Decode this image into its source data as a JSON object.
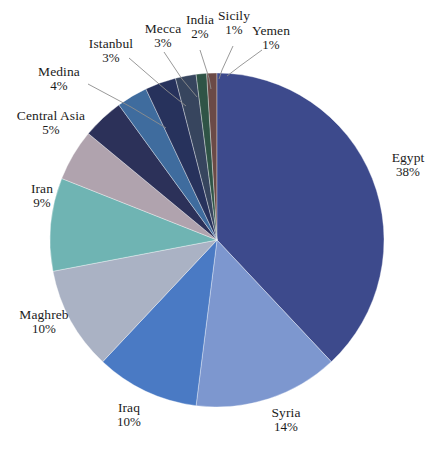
{
  "chart_data": {
    "type": "pie",
    "title": "",
    "subtitle": "",
    "xlabel": "",
    "ylabel": "",
    "legend_position": "none",
    "grid": false,
    "units": "%",
    "total": 100,
    "start_angle_deg": 0,
    "direction": "clockwise",
    "categories": [
      "Egypt",
      "Syria",
      "Iraq",
      "Maghreb",
      "Iran",
      "Central Asia",
      "Medina",
      "Istanbul",
      "Mecca",
      "India",
      "Sicily",
      "Yemen"
    ],
    "values": [
      38,
      14,
      10,
      10,
      9,
      5,
      4,
      3,
      3,
      2,
      1,
      1
    ],
    "slices": [
      {
        "label": "Egypt",
        "value": 38,
        "percent_text": "38%",
        "color": "#3d4a8c"
      },
      {
        "label": "Syria",
        "value": 14,
        "percent_text": "14%",
        "color": "#7d97cf"
      },
      {
        "label": "Iraq",
        "value": 10,
        "percent_text": "10%",
        "color": "#4a7ac4"
      },
      {
        "label": "Maghreb",
        "value": 10,
        "percent_text": "10%",
        "color": "#aab2c4"
      },
      {
        "label": "Iran",
        "value": 9,
        "percent_text": "9%",
        "color": "#6fb4b3"
      },
      {
        "label": "Central Asia",
        "value": 5,
        "percent_text": "5%",
        "color": "#b0a3ae"
      },
      {
        "label": "Medina",
        "value": 4,
        "percent_text": "4%",
        "color": "#2c3159"
      },
      {
        "label": "Istanbul",
        "value": 3,
        "percent_text": "3%",
        "color": "#3f6c9e"
      },
      {
        "label": "Mecca",
        "value": 3,
        "percent_text": "3%",
        "color": "#27325c"
      },
      {
        "label": "India",
        "value": 2,
        "percent_text": "2%",
        "color": "#37455e"
      },
      {
        "label": "Sicily",
        "value": 1,
        "percent_text": "1%",
        "color": "#2f5446"
      },
      {
        "label": "Yemen",
        "value": 1,
        "percent_text": "1%",
        "color": "#6b4a46"
      }
    ]
  },
  "labels": {
    "egypt": {
      "name": "Egypt",
      "percent": "38%"
    },
    "syria": {
      "name": "Syria",
      "percent": "14%"
    },
    "iraq": {
      "name": "Iraq",
      "percent": "10%"
    },
    "maghreb": {
      "name": "Maghreb",
      "percent": "10%"
    },
    "iran": {
      "name": "Iran",
      "percent": "9%"
    },
    "central_asia": {
      "name": "Central Asia",
      "percent": "5%"
    },
    "medina": {
      "name": "Medina",
      "percent": "4%"
    },
    "istanbul": {
      "name": "Istanbul",
      "percent": "3%"
    },
    "mecca": {
      "name": "Mecca",
      "percent": "3%"
    },
    "india": {
      "name": "India",
      "percent": "2%"
    },
    "sicily": {
      "name": "Sicily",
      "percent": "1%"
    },
    "yemen": {
      "name": "Yemen",
      "percent": "1%"
    }
  }
}
